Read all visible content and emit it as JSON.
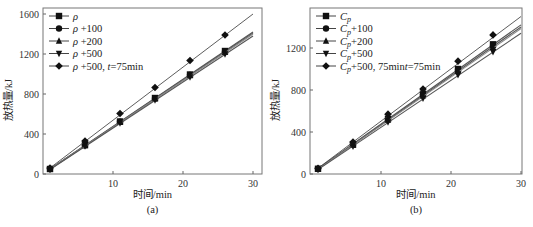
{
  "chart_data": [
    {
      "type": "line",
      "panel_label": "(a)",
      "xlabel": "时间/min",
      "ylabel": "放热量/kJ",
      "xlim": [
        0,
        30
      ],
      "ylim": [
        0,
        1600
      ],
      "xticks": [
        10,
        20,
        30
      ],
      "yticks": [
        0,
        400,
        800,
        1200,
        1600
      ],
      "grid": false,
      "legend_position": "top-left",
      "x": [
        1,
        6,
        11,
        16,
        21,
        26
      ],
      "series": [
        {
          "name": "ρ",
          "marker": "square",
          "values": [
            50,
            290,
            525,
            760,
            995,
            1230
          ],
          "fit_end": 1420
        },
        {
          "name": "ρ +100",
          "marker": "circle",
          "values": [
            50,
            288,
            522,
            755,
            990,
            1225
          ],
          "fit_end": 1410
        },
        {
          "name": "ρ +200",
          "marker": "triangle-up",
          "values": [
            48,
            285,
            518,
            752,
            985,
            1218
          ],
          "fit_end": 1400
        },
        {
          "name": "ρ +500",
          "marker": "triangle-down",
          "values": [
            45,
            280,
            510,
            740,
            970,
            1200
          ],
          "fit_end": 1380
        },
        {
          "name": "ρ +500, t=75min",
          "marker": "diamond",
          "values": [
            60,
            330,
            605,
            865,
            1135,
            1390
          ],
          "fit_end": 1600
        }
      ]
    },
    {
      "type": "line",
      "panel_label": "(b)",
      "xlabel": "时间/min",
      "ylabel": "放热量/kJ",
      "xlim": [
        0,
        30
      ],
      "ylim": [
        0,
        1500
      ],
      "xticks": [
        10,
        20,
        30
      ],
      "yticks": [
        0,
        400,
        800,
        1200
      ],
      "grid": false,
      "legend_position": "top-left",
      "x": [
        1,
        6,
        11,
        16,
        21,
        26
      ],
      "series": [
        {
          "name": "Cp",
          "marker": "square",
          "values": [
            50,
            280,
            525,
            765,
            1000,
            1235
          ],
          "fit_end": 1420
        },
        {
          "name": "Cp+100",
          "marker": "circle",
          "values": [
            48,
            278,
            520,
            755,
            990,
            1220
          ],
          "fit_end": 1400
        },
        {
          "name": "Cp+200",
          "marker": "triangle-up",
          "values": [
            46,
            275,
            515,
            745,
            978,
            1205
          ],
          "fit_end": 1385
        },
        {
          "name": "Cp+500",
          "marker": "triangle-down",
          "values": [
            42,
            265,
            495,
            720,
            945,
            1165
          ],
          "fit_end": 1340
        },
        {
          "name": "Cp+500, t=75min",
          "marker": "diamond",
          "values": [
            55,
            305,
            570,
            810,
            1075,
            1325
          ],
          "fit_end": 1500
        }
      ]
    }
  ]
}
